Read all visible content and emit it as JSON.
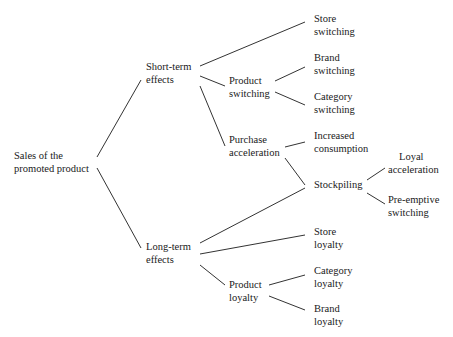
{
  "diagram": {
    "type": "tree",
    "root": {
      "id": "root",
      "lines": [
        "Sales of the",
        "promoted product"
      ]
    },
    "nodes": [
      {
        "id": "short",
        "lines": [
          "Short-term",
          "effects"
        ]
      },
      {
        "id": "long",
        "lines": [
          "Long-term",
          "effects"
        ]
      },
      {
        "id": "store_sw",
        "lines": [
          "Store",
          "switching"
        ]
      },
      {
        "id": "product_sw",
        "lines": [
          "Product",
          "switching"
        ]
      },
      {
        "id": "purchase_acc",
        "lines": [
          "Purchase",
          "acceleration"
        ]
      },
      {
        "id": "brand_sw",
        "lines": [
          "Brand",
          "switching"
        ]
      },
      {
        "id": "category_sw",
        "lines": [
          "Category",
          "switching"
        ]
      },
      {
        "id": "increased_cons",
        "lines": [
          "Increased",
          "consumption"
        ]
      },
      {
        "id": "stockpiling",
        "lines": [
          "Stockpiling"
        ]
      },
      {
        "id": "loyal_acc",
        "lines": [
          "Loyal",
          "acceleration"
        ]
      },
      {
        "id": "preemptive_sw",
        "lines": [
          "Pre-emptive",
          "switching"
        ]
      },
      {
        "id": "store_loy",
        "lines": [
          "Store",
          "loyalty"
        ]
      },
      {
        "id": "product_loy",
        "lines": [
          "Product",
          "loyalty"
        ]
      },
      {
        "id": "category_loy",
        "lines": [
          "Category",
          "loyalty"
        ]
      },
      {
        "id": "brand_loy",
        "lines": [
          "Brand",
          "loyalty"
        ]
      }
    ],
    "edges": [
      [
        "root",
        "short"
      ],
      [
        "root",
        "long"
      ],
      [
        "short",
        "store_sw"
      ],
      [
        "short",
        "product_sw"
      ],
      [
        "short",
        "purchase_acc"
      ],
      [
        "product_sw",
        "brand_sw"
      ],
      [
        "product_sw",
        "category_sw"
      ],
      [
        "purchase_acc",
        "increased_cons"
      ],
      [
        "purchase_acc",
        "stockpiling"
      ],
      [
        "stockpiling",
        "loyal_acc"
      ],
      [
        "stockpiling",
        "preemptive_sw"
      ],
      [
        "long",
        "stockpiling"
      ],
      [
        "long",
        "store_loy"
      ],
      [
        "long",
        "product_loy"
      ],
      [
        "product_loy",
        "category_loy"
      ],
      [
        "product_loy",
        "brand_loy"
      ]
    ]
  },
  "labels": {
    "root": {
      "l1": "Sales of the",
      "l2": "promoted product"
    },
    "short": {
      "l1": "Short-term",
      "l2": "effects"
    },
    "long": {
      "l1": "Long-term",
      "l2": "effects"
    },
    "store_sw": {
      "l1": "Store",
      "l2": "switching"
    },
    "product_sw": {
      "l1": "Product",
      "l2": "switching"
    },
    "purchase_acc": {
      "l1": "Purchase",
      "l2": "acceleration"
    },
    "brand_sw": {
      "l1": "Brand",
      "l2": "switching"
    },
    "category_sw": {
      "l1": "Category",
      "l2": "switching"
    },
    "increased_cons": {
      "l1": "Increased",
      "l2": "consumption"
    },
    "stockpiling": {
      "l1": "Stockpiling"
    },
    "loyal_acc": {
      "l1": "Loyal",
      "l2": "acceleration"
    },
    "preemptive_sw": {
      "l1": "Pre-emptive",
      "l2": "switching"
    },
    "store_loy": {
      "l1": "Store",
      "l2": "loyalty"
    },
    "product_loy": {
      "l1": "Product",
      "l2": "loyalty"
    },
    "category_loy": {
      "l1": "Category",
      "l2": "loyalty"
    },
    "brand_loy": {
      "l1": "Brand",
      "l2": "loyalty"
    }
  },
  "style": {
    "line_color": "#333333",
    "text_color": "#1a1a1a",
    "background": "#ffffff"
  }
}
